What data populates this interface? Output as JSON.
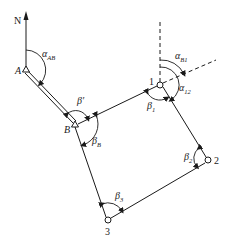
{
  "diagram": {
    "type": "traverse-survey",
    "north_label": "N",
    "points": {
      "A": {
        "label": "A",
        "symbol": "triangle"
      },
      "B": {
        "label": "B",
        "symbol": "triangle"
      },
      "p1": {
        "label": "1",
        "symbol": "circle"
      },
      "p2": {
        "label": "2",
        "symbol": "circle"
      },
      "p3": {
        "label": "3",
        "symbol": "circle"
      }
    },
    "angles": {
      "alpha_AB": {
        "base": "α",
        "sub": "AB"
      },
      "alpha_B1": {
        "base": "α",
        "sub": "B1"
      },
      "alpha_12": {
        "base": "α",
        "sub": "12"
      },
      "beta_prime": {
        "base": "β′",
        "sub": ""
      },
      "beta_B": {
        "base": "β",
        "sub": "B"
      },
      "beta_1": {
        "base": "β",
        "sub": "1"
      },
      "beta_2": {
        "base": "β",
        "sub": "2"
      },
      "beta_3": {
        "base": "β",
        "sub": "3"
      }
    }
  }
}
